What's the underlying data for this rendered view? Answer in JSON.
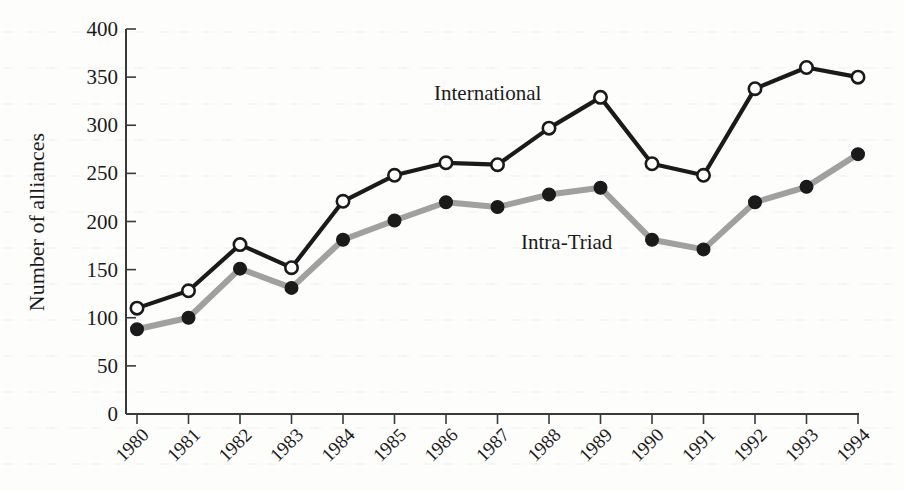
{
  "chart_data": {
    "type": "line",
    "title": "",
    "subtitle": "",
    "xlabel": "",
    "ylabel": "Number of alliances",
    "categories": [
      "1980",
      "1981",
      "1982",
      "1983",
      "1984",
      "1985",
      "1986",
      "1987",
      "1988",
      "1989",
      "1990",
      "1991",
      "1992",
      "1993",
      "1994"
    ],
    "x": [
      1980,
      1981,
      1982,
      1983,
      1984,
      1985,
      1986,
      1987,
      1988,
      1989,
      1990,
      1991,
      1992,
      1993,
      1994
    ],
    "xlim": [
      1980,
      1994
    ],
    "ylim": [
      0,
      400
    ],
    "yticks": [
      0,
      50,
      100,
      150,
      200,
      250,
      300,
      350,
      400
    ],
    "ytick_labels": [
      "0",
      "50",
      "100",
      "150",
      "200",
      "250",
      "300",
      "350",
      "400"
    ],
    "grid": false,
    "legend_position": "inline-annotations",
    "series": [
      {
        "name": "International",
        "color": "#1a1a1a",
        "marker": "open-circle",
        "marker_fill": "#ffffff",
        "values": [
          110,
          128,
          176,
          152,
          221,
          248,
          261,
          259,
          297,
          329,
          260,
          248,
          338,
          360,
          350
        ]
      },
      {
        "name": "Intra-Triad",
        "color": "#a0a0a0",
        "marker": "filled-circle",
        "marker_fill": "#1a1a1a",
        "values": [
          88,
          100,
          151,
          131,
          181,
          201,
          220,
          215,
          228,
          235,
          181,
          171,
          220,
          236,
          270
        ]
      }
    ],
    "annotations": [
      {
        "text": "International",
        "x_px": 434,
        "y_px": 100
      },
      {
        "text": "Intra-Triad",
        "x_px": 521,
        "y_px": 249
      }
    ]
  },
  "axes": {
    "y_axis_title": "Number of alliances",
    "y_tick_labels": [
      "400",
      "350",
      "300",
      "250",
      "200",
      "150",
      "100",
      "50",
      "0"
    ],
    "x_tick_labels": [
      "1980",
      "1981",
      "1982",
      "1983",
      "1984",
      "1985",
      "1986",
      "1987",
      "1988",
      "1989",
      "1990",
      "1991",
      "1992",
      "1993",
      "1994"
    ]
  },
  "colors": {
    "international_line": "#1a1a1a",
    "intra_triad_line": "#a0a0a0",
    "axis": "#3a3a3a",
    "text": "#1b1b1b",
    "background": "#fdfdfc"
  }
}
